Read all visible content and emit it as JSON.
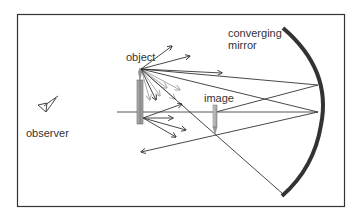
{
  "diagram": {
    "labels": {
      "object": "object",
      "image": "image",
      "observer": "observer",
      "mirror_line1": "converging",
      "mirror_line2": "mirror"
    },
    "elements": [
      {
        "name": "frame",
        "type": "rectangle"
      },
      {
        "name": "optical-axis",
        "type": "line"
      },
      {
        "name": "object",
        "type": "candle-arrow"
      },
      {
        "name": "image",
        "type": "small-arrow"
      },
      {
        "name": "converging-mirror",
        "type": "arc"
      },
      {
        "name": "observer",
        "type": "eye-icon"
      },
      {
        "name": "rays",
        "type": "arrows"
      }
    ],
    "colors": {
      "frame": "#333333",
      "ray": "#333333",
      "faint_ray": "#aaaaaa",
      "mirror": "#333333",
      "object_fill": "#999999",
      "text": "#333333"
    }
  }
}
